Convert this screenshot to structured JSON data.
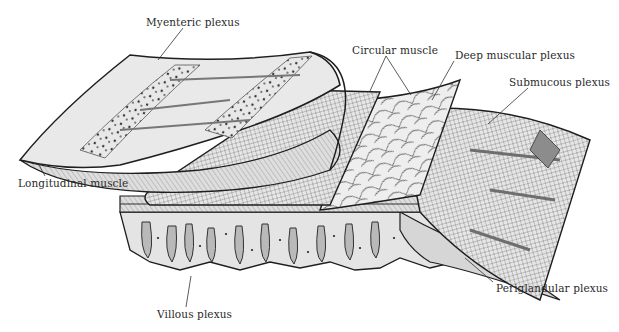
{
  "diagram": {
    "style": "pen-and-ink hatched illustration, grayscale",
    "labels": [
      {
        "id": "myenteric",
        "text": "Myenteric plexus",
        "x": 146,
        "y": 17,
        "line": [
          [
            183,
            28
          ],
          [
            158,
            60
          ]
        ]
      },
      {
        "id": "circular",
        "text": "Circular muscle",
        "x": 352,
        "y": 45,
        "line": [
          [
            386,
            56
          ],
          [
            370,
            91
          ]
        ],
        "line2": [
          [
            386,
            56
          ],
          [
            411,
            95
          ]
        ]
      },
      {
        "id": "deep-muscular",
        "text": "Deep muscular plexus",
        "x": 455,
        "y": 50,
        "line": [
          [
            454,
            61
          ],
          [
            432,
            100
          ]
        ]
      },
      {
        "id": "submucous",
        "text": "Submucous plexus",
        "x": 509,
        "y": 77,
        "line": [
          [
            528,
            88
          ],
          [
            488,
            124
          ]
        ]
      },
      {
        "id": "longitudinal",
        "text": "Longitudinal muscle",
        "x": 18,
        "y": 178,
        "line": [
          [
            45,
            176
          ],
          [
            38,
            163
          ]
        ]
      },
      {
        "id": "villous",
        "text": "Villous plexus",
        "x": 157,
        "y": 309,
        "line": [
          [
            186,
            307
          ],
          [
            191,
            276
          ]
        ]
      },
      {
        "id": "periglandular",
        "text": "Periglandular plexus",
        "x": 496,
        "y": 283,
        "line": [
          [
            493,
            282
          ],
          [
            465,
            258
          ]
        ]
      }
    ],
    "colors": {
      "ink": "#1e1e1e",
      "light_fill": "#ececec",
      "mid_fill": "#cfcfcf",
      "dark_fill": "#9a9a9a",
      "background": "#ffffff"
    }
  }
}
